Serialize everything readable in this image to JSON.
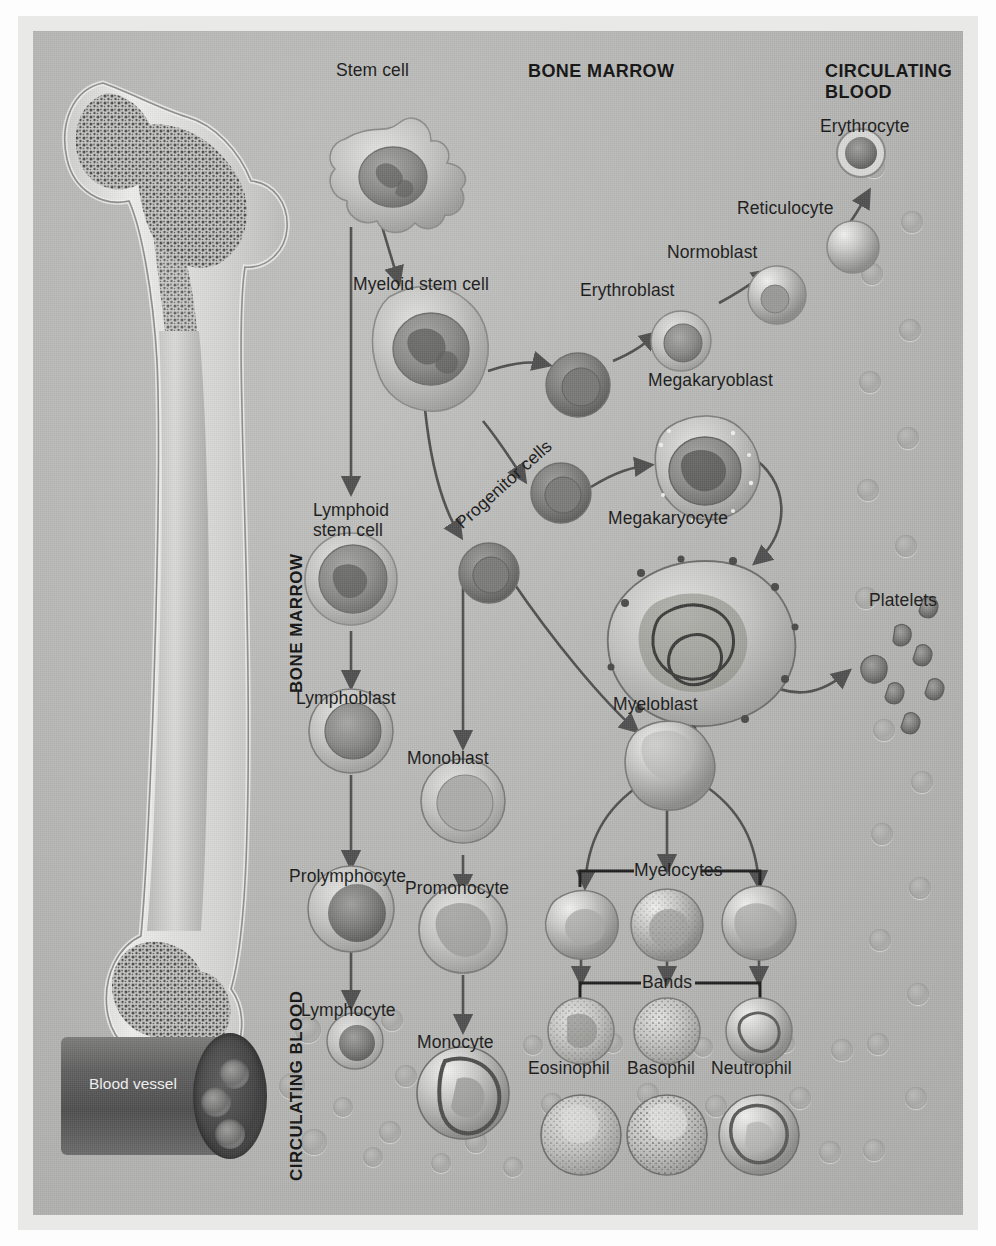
{
  "figure": {
    "panel_bg": "#b9b9b7",
    "frame_bg": "#e9e9e7",
    "text_color": "#191919",
    "arrow_color": "#4a4a4a"
  },
  "headers": {
    "bone_marrow_top": "BONE MARROW",
    "circulating_blood_top": "CIRCULATING\nBLOOD",
    "bone_marrow_side": "BONE MARROW",
    "circulating_blood_side": "CIRCULATING BLOOD"
  },
  "labels": {
    "stem_cell": "Stem cell",
    "myeloid_stem_cell": "Myeloid stem cell",
    "lymphoid_stem_cell": "Lymphoid\nstem cell",
    "progenitor_cells": "Progenitor cells",
    "erythroblast": "Erythroblast",
    "normoblast": "Normoblast",
    "reticulocyte": "Reticulocyte",
    "erythrocyte": "Erythrocyte",
    "megakaryoblast": "Megakaryoblast",
    "megakaryocyte": "Megakaryocyte",
    "platelets": "Platelets",
    "myeloblast": "Myeloblast",
    "myelocytes": "Myelocytes",
    "bands": "Bands",
    "eosinophil": "Eosinophil",
    "basophil": "Basophil",
    "neutrophil": "Neutrophil",
    "lymphoblast": "Lymphoblast",
    "prolymphocyte": "Prolymphocyte",
    "lymphocyte": "Lymphocyte",
    "monoblast": "Monoblast",
    "promonocyte": "Promonocyte",
    "monocyte": "Monocyte",
    "blood_vessel": "Blood\nvessel"
  },
  "lineages": [
    {
      "name": "erythroid",
      "stages": [
        "Myeloid stem cell",
        "Erythroblast",
        "Normoblast",
        "Reticulocyte",
        "Erythrocyte"
      ]
    },
    {
      "name": "megakaryocytic",
      "stages": [
        "Progenitor cells",
        "Megakaryoblast",
        "Megakaryocyte",
        "Platelets"
      ]
    },
    {
      "name": "granulocytic",
      "stages": [
        "Myeloblast",
        "Myelocytes",
        "Bands",
        "Eosinophil",
        "Basophil",
        "Neutrophil"
      ]
    },
    {
      "name": "monocytic",
      "stages": [
        "Monoblast",
        "Promonocyte",
        "Monocyte"
      ]
    },
    {
      "name": "lymphoid",
      "stages": [
        "Lymphoid stem cell",
        "Lymphoblast",
        "Prolymphocyte",
        "Lymphocyte"
      ]
    }
  ]
}
